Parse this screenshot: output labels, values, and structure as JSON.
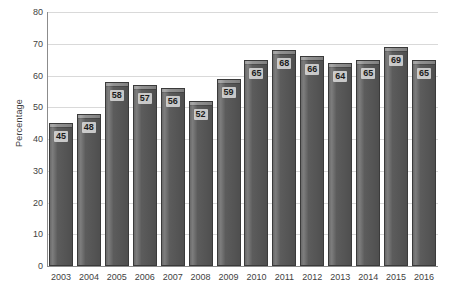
{
  "chart_data": {
    "type": "bar",
    "title": "",
    "subtitle": "",
    "xlabel": "",
    "ylabel": "Percentage",
    "categories": [
      "2003",
      "2004",
      "2005",
      "2006",
      "2007",
      "2008",
      "2009",
      "2010",
      "2011",
      "2012",
      "2013",
      "2014",
      "2015",
      "2016"
    ],
    "values": [
      45,
      48,
      58,
      57,
      56,
      52,
      59,
      65,
      68,
      66,
      64,
      65,
      69,
      65
    ],
    "data_labels": [
      "45",
      "48",
      "58",
      "57",
      "56",
      "52",
      "59",
      "65",
      "68",
      "66",
      "64",
      "65",
      "69",
      "65"
    ],
    "ylim": [
      0,
      80
    ],
    "ytick_step": 10,
    "ytick_labels": [
      "80",
      "70",
      "60",
      "50",
      "40",
      "30",
      "20",
      "10",
      "0"
    ],
    "ytick_values": [
      80,
      70,
      60,
      50,
      40,
      30,
      20,
      10,
      0
    ],
    "grid": "horizontal",
    "legend": "none",
    "series": [
      {
        "name": "Percentage",
        "values": [
          45,
          48,
          58,
          57,
          56,
          52,
          59,
          65,
          68,
          66,
          64,
          65,
          69,
          65
        ]
      }
    ],
    "colors": {
      "bar_fill": "#595959",
      "bar_outline": "#3a3a3a",
      "bar_cap": "#8f8f8f",
      "gridline": "#d9d9d9",
      "axis": "#8c8c8c",
      "text": "#3f3f3f",
      "background": "#ffffff"
    }
  }
}
